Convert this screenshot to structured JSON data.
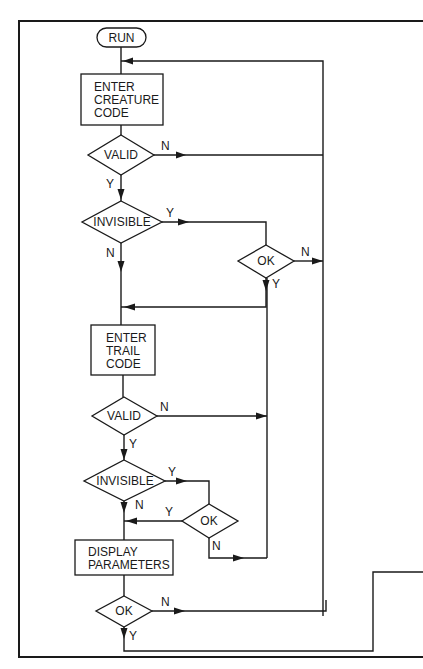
{
  "diagram": {
    "type": "flowchart",
    "colors": {
      "ink": "#1a1a1a",
      "paper": "#ffffff"
    },
    "nodes": {
      "run": {
        "kind": "terminal",
        "label": "RUN"
      },
      "enter_creature": {
        "kind": "process",
        "lines": [
          "ENTER",
          "CREATURE",
          "CODE"
        ]
      },
      "valid1": {
        "kind": "decision",
        "label": "VALID",
        "yes": "Y",
        "no": "N"
      },
      "invisible1": {
        "kind": "decision",
        "label": "INVISIBLE",
        "yes": "Y",
        "no": "N"
      },
      "ok1": {
        "kind": "decision",
        "label": "OK",
        "yes": "Y",
        "no": "N"
      },
      "enter_trail": {
        "kind": "process",
        "lines": [
          "ENTER",
          "TRAIL",
          "CODE"
        ]
      },
      "valid2": {
        "kind": "decision",
        "label": "VALID",
        "yes": "Y",
        "no": "N"
      },
      "invisible2": {
        "kind": "decision",
        "label": "INVISIBLE",
        "yes": "Y",
        "no": "N"
      },
      "ok2": {
        "kind": "decision",
        "label": "OK",
        "yes": "Y",
        "no": "N"
      },
      "display": {
        "kind": "process",
        "lines": [
          "DISPLAY",
          "PARAMETERS"
        ]
      },
      "ok3": {
        "kind": "decision",
        "label": "OK",
        "yes": "Y",
        "no": "N"
      }
    },
    "edges": [
      {
        "from": "run",
        "to": "enter_creature"
      },
      {
        "from": "enter_creature",
        "to": "valid1"
      },
      {
        "from": "valid1",
        "to": "enter_creature",
        "label": "N"
      },
      {
        "from": "valid1",
        "to": "invisible1",
        "label": "Y"
      },
      {
        "from": "invisible1",
        "to": "ok1",
        "label": "Y"
      },
      {
        "from": "invisible1",
        "to": "enter_trail",
        "label": "N"
      },
      {
        "from": "ok1",
        "to": "enter_creature",
        "label": "N"
      },
      {
        "from": "ok1",
        "to": "enter_trail",
        "label": "Y"
      },
      {
        "from": "enter_trail",
        "to": "valid2"
      },
      {
        "from": "valid2",
        "to": "enter_trail",
        "label": "N"
      },
      {
        "from": "valid2",
        "to": "invisible2",
        "label": "Y"
      },
      {
        "from": "invisible2",
        "to": "ok2",
        "label": "Y"
      },
      {
        "from": "invisible2",
        "to": "display",
        "label": "N"
      },
      {
        "from": "ok2",
        "to": "display",
        "label": "Y"
      },
      {
        "from": "ok2",
        "to": "enter_trail",
        "label": "N"
      },
      {
        "from": "display",
        "to": "ok3"
      },
      {
        "from": "ok3",
        "to": "enter_creature",
        "label": "N"
      },
      {
        "from": "ok3",
        "to": "exit",
        "label": "Y"
      }
    ]
  }
}
